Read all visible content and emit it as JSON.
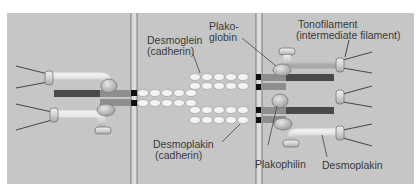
{
  "figure": {
    "type": "desmosome-junction-diagram",
    "background_color": "#c6c6c6",
    "membrane_color": "#d9d9d9",
    "membrane_line_color": "#6a6a6a",
    "plaque_dark_color": "#4a4a4a",
    "plaque_mid_color": "#8e8e8e",
    "cadherin_bead_color": "#f4f4f4",
    "protein_color": "#d3d3d3"
  },
  "labels": {
    "desmoglein": {
      "line1": "Desmoglein",
      "line2": "(cadherin)"
    },
    "plakoglobin": {
      "line1": "Plako-",
      "line2": "globin"
    },
    "tonofilament": {
      "line1": "Tonofilament",
      "line2": "(intermediate filament)"
    },
    "desmoplakin_cadherin": {
      "line1": "Desmoplakin",
      "line2": "(cadherin)"
    },
    "plakophilin": "Plakophilin",
    "desmoplakin": "Desmoplakin"
  }
}
